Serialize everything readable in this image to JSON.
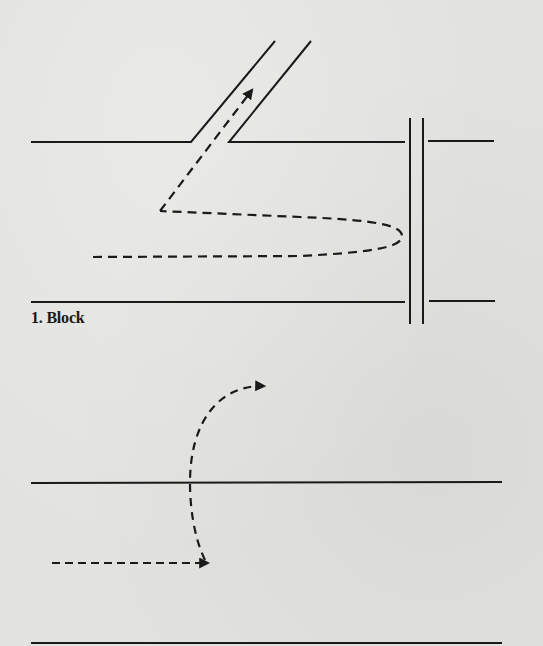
{
  "figure": {
    "panels": [
      {
        "id": "block",
        "label": "1. Block",
        "elements": {
          "top_wall": "horizontal line with angled side passage",
          "side_passage": "diagonal channel toward upper right",
          "barrier": "vertical double line at right",
          "bottom_wall": "horizontal line",
          "path": "dashed path looping right toward barrier, turning back left, then up into side passage with arrow"
        }
      },
      {
        "id": "crossing",
        "label": "",
        "elements": {
          "top_line": "horizontal line",
          "bottom_line": "horizontal line",
          "path": "dashed path moving right, then curving upward across top line, ending in arrow to the right"
        }
      }
    ],
    "colors": {
      "paper": "#e2e2e0",
      "ink": "#1a1a1a"
    }
  }
}
